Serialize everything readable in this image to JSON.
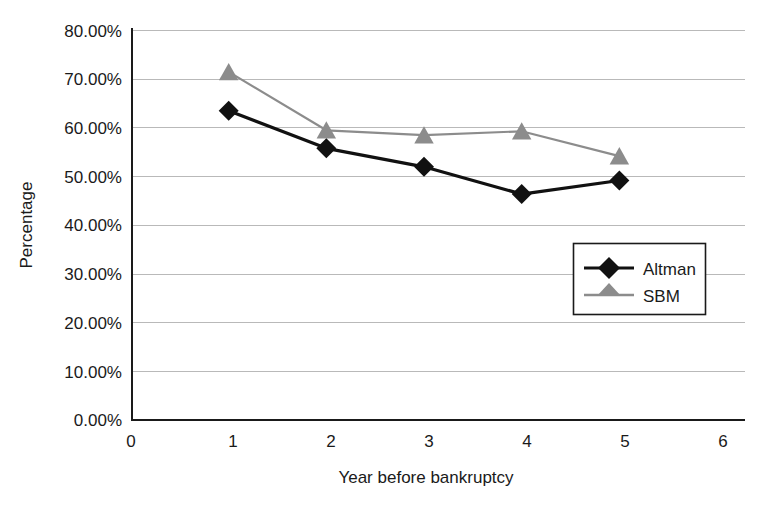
{
  "chart_data": {
    "type": "line",
    "title": "",
    "xlabel": "Year before bankruptcy",
    "ylabel": "Percentage",
    "x": [
      1,
      2,
      3,
      4,
      5
    ],
    "xlim": [
      0,
      6
    ],
    "ylim": [
      0,
      80
    ],
    "xticks": [
      "0",
      "1",
      "2",
      "3",
      "4",
      "5",
      "6"
    ],
    "yticks": [
      "0.00%",
      "10.00%",
      "20.00%",
      "30.00%",
      "40.00%",
      "50.00%",
      "60.00%",
      "70.00%",
      "80.00%"
    ],
    "ytick_values": [
      0,
      10,
      20,
      30,
      40,
      50,
      60,
      70,
      80
    ],
    "grid": "horizontal",
    "legend_position": "inside-right",
    "series": [
      {
        "name": "Altman",
        "marker": "diamond",
        "color": "#111111",
        "values": [
          63.5,
          55.8,
          52.0,
          46.4,
          49.2
        ]
      },
      {
        "name": "SBM",
        "marker": "triangle",
        "color": "#8c8c8c",
        "values": [
          71.5,
          59.5,
          58.5,
          59.3,
          54.2
        ]
      }
    ]
  },
  "colors": {
    "altman": "#111111",
    "sbm": "#8c8c8c",
    "grid": "#b9b9b9",
    "axis": "#1a1a1a",
    "background": "#ffffff"
  }
}
